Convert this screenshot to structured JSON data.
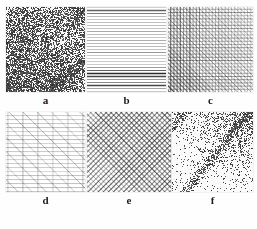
{
  "figure": {
    "background_color": "#ffffff",
    "ink_color": "#1b1b1b",
    "panel_count": 6,
    "rows": 2,
    "columns": 3
  },
  "panels": [
    {
      "label": "a",
      "name": "panel-a",
      "texture": "error-diffusion-dither",
      "description": "dense stochastic grayscale dither with diagonal ridge structures",
      "render": {
        "kind": "noise",
        "seed": 17,
        "base_density": 0.52,
        "dot_size": 1,
        "ridges": [
          {
            "angle_deg": 45,
            "offset": 0.18,
            "width": 0.16,
            "strength": 0.32
          },
          {
            "angle_deg": -40,
            "offset": 0.62,
            "width": 0.22,
            "strength": 0.3
          },
          {
            "angle_deg": 55,
            "offset": 0.8,
            "width": 0.12,
            "strength": 0.22
          }
        ],
        "dark_corner": "bottom-left"
      }
    },
    {
      "label": "b",
      "name": "panel-b",
      "texture": "horizontal-line-screen",
      "description": "horizontal scan lines of varying thickness and density",
      "render": {
        "kind": "lines",
        "seed": 23,
        "angles_deg": [
          0
        ],
        "spacing": 3.0,
        "line_alpha_min": 0.08,
        "line_alpha_max": 0.85,
        "dark_bands": [
          {
            "center": 0.78,
            "width": 0.1,
            "strength": 0.9
          },
          {
            "center": 0.06,
            "width": 0.05,
            "strength": 0.55
          },
          {
            "center": 0.93,
            "width": 0.05,
            "strength": 0.6
          }
        ]
      }
    },
    {
      "label": "c",
      "name": "panel-c",
      "texture": "orthogonal-plus-diagonal-crosshatch",
      "description": "fine grid of horizontal and vertical rules overlaid with diagonal hatching, darker at left",
      "render": {
        "kind": "grid",
        "seed": 31,
        "angles_deg": [
          0,
          90,
          45
        ],
        "spacing": 3.2,
        "line_alpha_min": 0.12,
        "line_alpha_max": 0.7,
        "gradient": "left-dark"
      }
    },
    {
      "label": "d",
      "name": "panel-d",
      "texture": "sparse-grid-with-diagonals",
      "description": "light horizontal rules, widely spaced vertical rules and up-right diagonals",
      "render": {
        "kind": "grid",
        "seed": 47,
        "angles_deg": [
          0,
          90,
          45
        ],
        "spacing_h": 4.0,
        "spacing_v": 15.0,
        "spacing_d": 10.0,
        "line_alpha_min": 0.1,
        "line_alpha_max": 0.55,
        "gradient": "uniform"
      }
    },
    {
      "label": "e",
      "name": "panel-e",
      "texture": "diagonal-crosshatch",
      "description": "bidirectional 45 degree cross-hatch, dense toward upper-right, single direction lower-left",
      "render": {
        "kind": "crosshatch",
        "seed": 53,
        "angles_deg": [
          45,
          -45
        ],
        "spacing": 3.6,
        "line_alpha_min": 0.12,
        "line_alpha_max": 0.62,
        "gradient": "top-right-dark"
      }
    },
    {
      "label": "f",
      "name": "panel-f",
      "texture": "stochastic-dot-dither",
      "description": "random blue-noise dot dithering forming diagonal bands on white",
      "render": {
        "kind": "noise",
        "seed": 71,
        "base_density": 0.06,
        "dot_size": 1,
        "ridges": [
          {
            "angle_deg": 38,
            "offset": 0.3,
            "width": 0.09,
            "strength": 0.55
          },
          {
            "angle_deg": 38,
            "offset": 0.62,
            "width": 0.08,
            "strength": 0.5
          },
          {
            "angle_deg": -50,
            "offset": 0.9,
            "width": 0.3,
            "strength": 0.45
          }
        ],
        "dark_corner": "top-right"
      }
    }
  ]
}
